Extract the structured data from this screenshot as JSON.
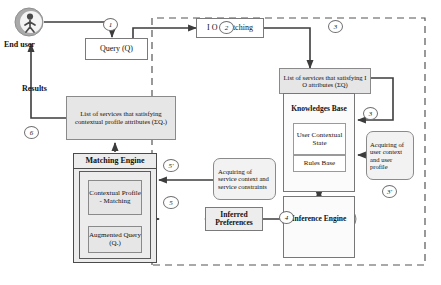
{
  "figure": {
    "kind": "flow-diagram",
    "boundary_label": "dashed-system-boundary"
  },
  "actors": {
    "end_user_label": "End user",
    "end_user_icon": "person-avatar-icon",
    "results_label": "Results"
  },
  "nodes": {
    "query": "Query (Q)",
    "io_matching": "I O -Matching",
    "list_io": "List of services that satisfying I O attributes (ΣQ)",
    "list_contextual": "List of services that satisfying contextual profile attributes (ΣQₐ)",
    "knowledges_base": "Knowledges Base",
    "user_contextual_state": "User Contextual State",
    "rules_base": "Rules Base",
    "inference_engine": "Inference Engine",
    "inferred_preferences": "Inferred Preferences",
    "acquiring_user": "Acquiring of user context and user profile",
    "acquiring_service": "Acquiring of service context and service constraints",
    "matching_engine": "Matching Engine",
    "contextual_profile_matching": "Contextual Profile - Matching",
    "augmented_query": "Augmented Query (Qₐ)"
  },
  "step_markers": {
    "s1": "1",
    "s2": "2",
    "s3_top": "3",
    "s3_kb": "3",
    "s3_prime": "3'",
    "s4": "4",
    "s5_prime": "5'",
    "s5": "5",
    "s6": "6"
  },
  "colors": {
    "shaded_fill": "#e6e6e6",
    "rounded_fill": "#f2f2f2",
    "stroke": "#7a7a7a",
    "arrow": "#3c3c3c",
    "text": "#111111",
    "boundary": "#555555"
  }
}
